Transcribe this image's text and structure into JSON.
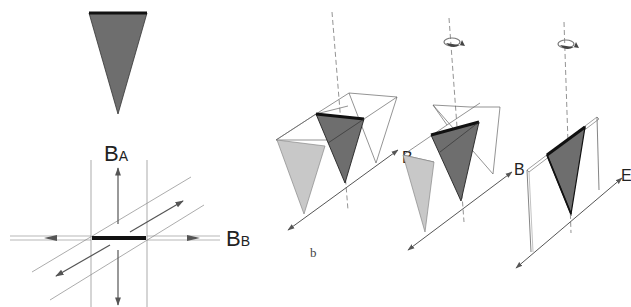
{
  "figure": {
    "panel_a": {
      "labels": {
        "field_a": "B",
        "field_a_sub": "A",
        "field_b": "B",
        "field_b_sub": "B"
      }
    },
    "panel_b": {
      "caption": "b",
      "stage2_label": "B",
      "stage1_label": "B",
      "stage3_label": "E"
    },
    "colors": {
      "dark_gray": "#6e6e6e",
      "light_gray": "#c8c8c8",
      "line": "#555555",
      "edge": "#111111"
    }
  }
}
